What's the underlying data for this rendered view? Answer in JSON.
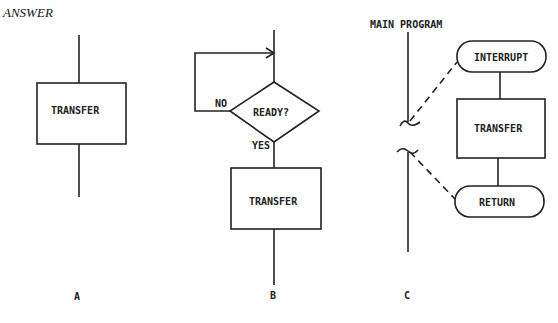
{
  "heading": "ANSWER",
  "diagrams": {
    "a": {
      "caption": "A",
      "box_label": "TRANSFER"
    },
    "b": {
      "caption": "B",
      "decision_label": "READY?",
      "no_label": "NO",
      "yes_label": "YES",
      "box_label": "TRANSFER"
    },
    "c": {
      "caption": "C",
      "main_label": "MAIN PROGRAM",
      "interrupt_label": "INTERRUPT",
      "box_label": "TRANSFER",
      "return_label": "RETURN"
    }
  },
  "colors": {
    "line": "#222222",
    "background": "#ffffff"
  }
}
